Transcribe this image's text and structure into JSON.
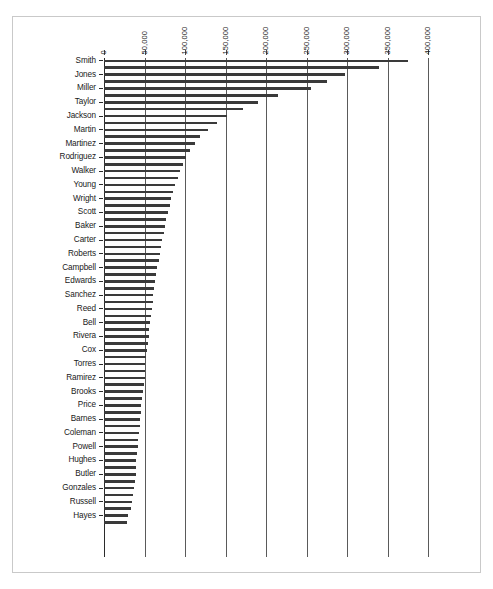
{
  "chart_data": {
    "type": "bar",
    "orientation": "horizontal",
    "title": "",
    "subtitle": "",
    "xlabel": "",
    "ylabel": "",
    "xlim": [
      0,
      400000
    ],
    "ylim": null,
    "grid": true,
    "legend": null,
    "legend_position": "none",
    "tick_interval": 50000,
    "tick_labels": [
      "0",
      "50,000",
      "100,000",
      "150,000",
      "200,000",
      "250,000",
      "300,000",
      "350,000",
      "400,000"
    ],
    "tick_values": [
      0,
      50000,
      100000,
      150000,
      200000,
      250000,
      300000,
      350000,
      400000
    ],
    "axis_position": "top",
    "bar_color": "#3a3a3a",
    "background_color": "#ffffff",
    "frame_color": "#c9c9c9",
    "categories": [
      "Smith",
      "Jones",
      "Miller",
      "Taylor",
      "Jackson",
      "Martin",
      "Martinez",
      "Rodriguez",
      "Walker",
      "Young",
      "Wright",
      "Scott",
      "Baker",
      "Carter",
      "Roberts",
      "Campbell",
      "Edwards",
      "Sanchez",
      "Reed",
      "Bell",
      "Rivera",
      "Cox",
      "Torres",
      "Ramirez",
      "Brooks",
      "Price",
      "Barnes",
      "Coleman",
      "Powell",
      "Hughes",
      "Butler",
      "Gonzales",
      "Russell",
      "Hayes"
    ],
    "values": [
      375000,
      297000,
      255000,
      190000,
      152000,
      128000,
      112000,
      101000,
      94000,
      88000,
      83000,
      79000,
      75000,
      72000,
      69000,
      66000,
      63000,
      61000,
      59000,
      57000,
      55000,
      53000,
      51000,
      50000,
      48000,
      46000,
      45000,
      43000,
      42000,
      40000,
      39000,
      37000,
      35000,
      30000
    ],
    "bar_count": 74,
    "note": "Each labeled category row is drawn as a pair of adjacent thin bars; labels appear on alternating bars.",
    "bars": [
      {
        "label": "Smith",
        "value": 375000
      },
      {
        "label": "",
        "value": 340000
      },
      {
        "label": "Jones",
        "value": 297000
      },
      {
        "label": "",
        "value": 275000
      },
      {
        "label": "Miller",
        "value": 255000
      },
      {
        "label": "",
        "value": 215000
      },
      {
        "label": "Taylor",
        "value": 190000
      },
      {
        "label": "",
        "value": 172000
      },
      {
        "label": "Jackson",
        "value": 152000
      },
      {
        "label": "",
        "value": 140000
      },
      {
        "label": "Martin",
        "value": 128000
      },
      {
        "label": "",
        "value": 119000
      },
      {
        "label": "Martinez",
        "value": 112000
      },
      {
        "label": "",
        "value": 106000
      },
      {
        "label": "Rodriguez",
        "value": 101000
      },
      {
        "label": "",
        "value": 97000
      },
      {
        "label": "Walker",
        "value": 94000
      },
      {
        "label": "",
        "value": 91000
      },
      {
        "label": "Young",
        "value": 88000
      },
      {
        "label": "",
        "value": 85000
      },
      {
        "label": "Wright",
        "value": 83000
      },
      {
        "label": "",
        "value": 81000
      },
      {
        "label": "Scott",
        "value": 79000
      },
      {
        "label": "",
        "value": 77000
      },
      {
        "label": "Baker",
        "value": 75000
      },
      {
        "label": "",
        "value": 73500
      },
      {
        "label": "Carter",
        "value": 72000
      },
      {
        "label": "",
        "value": 70500
      },
      {
        "label": "Roberts",
        "value": 69000
      },
      {
        "label": "",
        "value": 67500
      },
      {
        "label": "Campbell",
        "value": 66000
      },
      {
        "label": "",
        "value": 64500
      },
      {
        "label": "Edwards",
        "value": 63000
      },
      {
        "label": "",
        "value": 62000
      },
      {
        "label": "Sanchez",
        "value": 61000
      },
      {
        "label": "",
        "value": 60000
      },
      {
        "label": "Reed",
        "value": 59000
      },
      {
        "label": "",
        "value": 58000
      },
      {
        "label": "Bell",
        "value": 57000
      },
      {
        "label": "",
        "value": 56000
      },
      {
        "label": "Rivera",
        "value": 55000
      },
      {
        "label": "",
        "value": 54000
      },
      {
        "label": "Cox",
        "value": 53000
      },
      {
        "label": "",
        "value": 52000
      },
      {
        "label": "Torres",
        "value": 51000
      },
      {
        "label": "",
        "value": 50500
      },
      {
        "label": "Ramirez",
        "value": 50000
      },
      {
        "label": "",
        "value": 49000
      },
      {
        "label": "Brooks",
        "value": 48000
      },
      {
        "label": "",
        "value": 47000
      },
      {
        "label": "Price",
        "value": 46000
      },
      {
        "label": "",
        "value": 45500
      },
      {
        "label": "Barnes",
        "value": 45000
      },
      {
        "label": "",
        "value": 44000
      },
      {
        "label": "Coleman",
        "value": 43000
      },
      {
        "label": "",
        "value": 42500
      },
      {
        "label": "Powell",
        "value": 42000
      },
      {
        "label": "",
        "value": 41000
      },
      {
        "label": "Hughes",
        "value": 40000
      },
      {
        "label": "",
        "value": 39500
      },
      {
        "label": "Butler",
        "value": 39000
      },
      {
        "label": "",
        "value": 38000
      },
      {
        "label": "Gonzales",
        "value": 37000
      },
      {
        "label": "",
        "value": 36000
      },
      {
        "label": "Russell",
        "value": 35000
      },
      {
        "label": "",
        "value": 33000
      },
      {
        "label": "Hayes",
        "value": 30000
      },
      {
        "label": "",
        "value": 28000
      }
    ]
  }
}
